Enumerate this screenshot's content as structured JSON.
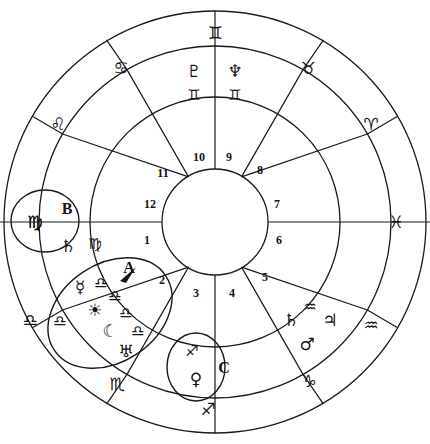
{
  "chart": {
    "type": "astrology-wheel",
    "geometry": {
      "center_x": 215,
      "center_y": 222,
      "r_outer": 212,
      "r_zodiac_inner": 176,
      "r_planet_inner": 125,
      "r_house_inner": 53
    },
    "stroke_color": "#1a1a1a",
    "text_color": "#141414",
    "background": "#ffffff"
  },
  "zodiac_ring": {
    "label": "Outer zodiac sign ring",
    "signs": [
      {
        "name": "gemini",
        "glyph": "♊",
        "angle_deg": 90,
        "x": 215,
        "y": 33
      },
      {
        "name": "cancer",
        "glyph": "♋",
        "angle_deg": 120,
        "x": 121,
        "y": 68
      },
      {
        "name": "leo",
        "glyph": "♌",
        "angle_deg": 150,
        "x": 58,
        "y": 124
      },
      {
        "name": "virgo",
        "glyph": "♍",
        "angle_deg": 180,
        "x": 35,
        "y": 222
      },
      {
        "name": "libra",
        "glyph": "♎",
        "angle_deg": 210,
        "x": 30,
        "y": 320
      },
      {
        "name": "scorpio",
        "glyph": "♏",
        "angle_deg": 240,
        "x": 117,
        "y": 384
      },
      {
        "name": "sagittarius",
        "glyph": "♐",
        "angle_deg": 270,
        "x": 208,
        "y": 409
      },
      {
        "name": "capricorn",
        "glyph": "♑",
        "angle_deg": 300,
        "x": 309,
        "y": 381
      },
      {
        "name": "aquarius",
        "glyph": "♒",
        "angle_deg": 330,
        "x": 371,
        "y": 325
      },
      {
        "name": "pisces",
        "glyph": "♓",
        "angle_deg": 0,
        "x": 396,
        "y": 222
      },
      {
        "name": "aries",
        "glyph": "♈",
        "angle_deg": 30,
        "x": 371,
        "y": 124
      },
      {
        "name": "taurus",
        "glyph": "♉",
        "angle_deg": 60,
        "x": 308,
        "y": 68
      }
    ]
  },
  "house_numbers": {
    "label": "House numbers ring",
    "houses": [
      {
        "number": "1",
        "x": 147,
        "y": 240
      },
      {
        "number": "2",
        "x": 162,
        "y": 280
      },
      {
        "number": "3",
        "x": 196,
        "y": 293
      },
      {
        "number": "4",
        "x": 232,
        "y": 293
      },
      {
        "number": "5",
        "x": 265,
        "y": 277
      },
      {
        "number": "6",
        "x": 279,
        "y": 240
      },
      {
        "number": "7",
        "x": 277,
        "y": 204
      },
      {
        "number": "8",
        "x": 260,
        "y": 170
      },
      {
        "number": "9",
        "x": 229,
        "y": 157
      },
      {
        "number": "10",
        "x": 199,
        "y": 157
      },
      {
        "number": "11",
        "x": 163,
        "y": 173
      },
      {
        "number": "12",
        "x": 150,
        "y": 204
      }
    ]
  },
  "planets": {
    "label": "Planet glyphs placed in houses",
    "items": [
      {
        "name": "pluto",
        "glyph": "♇",
        "sign_glyph": "♊",
        "sign_name": "gemini",
        "x": 194,
        "y": 71,
        "sign_x": 194,
        "sign_y": 95
      },
      {
        "name": "neptune",
        "glyph": "♆",
        "sign_glyph": "♊",
        "sign_name": "gemini",
        "x": 235,
        "y": 71,
        "sign_x": 235,
        "sign_y": 95
      },
      {
        "name": "saturn",
        "glyph": "♄",
        "sign_glyph": "♍",
        "sign_name": "virgo",
        "x": 68,
        "y": 246,
        "sign_x": 95,
        "sign_y": 244
      },
      {
        "name": "mercury",
        "glyph": "☿",
        "sign_glyph": "♎",
        "sign_name": "libra",
        "x": 80,
        "y": 287,
        "sign_x": 101,
        "sign_y": 283
      },
      {
        "name": "sun",
        "glyph": "☀",
        "sign_glyph": "♎",
        "sign_name": "libra",
        "x": 95,
        "y": 310,
        "sign_x": 115,
        "sign_y": 296
      },
      {
        "name": "moon",
        "glyph": "☾",
        "sign_glyph": "♎",
        "sign_name": "libra",
        "x": 110,
        "y": 331,
        "sign_x": 126,
        "sign_y": 313
      },
      {
        "name": "uranus",
        "glyph": "♅",
        "sign_glyph": "♎",
        "sign_name": "libra",
        "x": 126,
        "y": 351,
        "sign_x": 138,
        "sign_y": 331
      },
      {
        "name": "venus",
        "glyph": "♀",
        "sign_glyph": "♐",
        "sign_name": "sagittarius",
        "x": 196,
        "y": 379,
        "sign_x": 192,
        "sign_y": 351
      },
      {
        "name": "mars",
        "glyph": "♂",
        "sign_glyph": "♑",
        "sign_name": "capricorn",
        "x": 307,
        "y": 344,
        "sign_x": 309,
        "sign_y": 381
      },
      {
        "name": "jupiter",
        "glyph": "♃",
        "sign_glyph": "♒",
        "sign_name": "aquarius",
        "x": 330,
        "y": 320,
        "sign_x": 310,
        "sign_y": 307
      },
      {
        "name": "saturn-capricorn-outer",
        "glyph": "♄",
        "sign_glyph": "♑",
        "sign_name": "capricorn",
        "x": 291,
        "y": 320,
        "sign_x": 291,
        "sign_y": 320
      }
    ]
  },
  "house_sign_labels": {
    "label": "Additional sign glyphs inside planet ring",
    "items": [
      {
        "name": "libra-left",
        "glyph": "♎",
        "x": 60,
        "y": 321
      },
      {
        "name": "virgo-circle",
        "glyph": "♍",
        "x": 35,
        "y": 222
      }
    ]
  },
  "annotations": {
    "label": "Highlight circles and letter callouts",
    "ellipses": [
      {
        "name": "highlight-b",
        "cx": 45,
        "cy": 221,
        "rx": 34,
        "ry": 31,
        "rotation": 0
      },
      {
        "name": "highlight-a",
        "cx": 110,
        "cy": 313,
        "rx": 67,
        "ry": 49,
        "rotation": -34
      },
      {
        "name": "highlight-c",
        "cx": 196,
        "cy": 367,
        "rx": 29,
        "ry": 34,
        "rotation": 0
      }
    ],
    "markers": [
      {
        "name": "marker-a",
        "letter": "A",
        "x": 129,
        "y": 268
      },
      {
        "name": "marker-b",
        "letter": "B",
        "x": 67,
        "y": 209
      },
      {
        "name": "marker-c",
        "letter": "C",
        "x": 224,
        "y": 368
      }
    ],
    "arrowhead": {
      "name": "marker-a-arrowhead",
      "x": 127,
      "y": 273,
      "angle_deg": -34
    }
  }
}
